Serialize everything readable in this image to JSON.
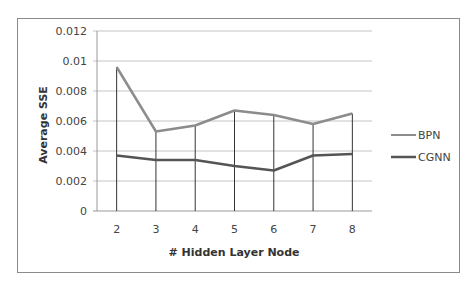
{
  "chart_data": {
    "type": "line",
    "title": "",
    "xlabel": "# Hidden Layer Node",
    "ylabel": "Average SSE",
    "x": [
      2,
      3,
      4,
      5,
      6,
      7,
      8
    ],
    "categories": [
      "2",
      "3",
      "4",
      "5",
      "6",
      "7",
      "8"
    ],
    "ylim": [
      0,
      0.012
    ],
    "yticks": [
      "0",
      "0.002",
      "0.004",
      "0.006",
      "0.008",
      "0.01",
      "0.012"
    ],
    "grid": true,
    "legend_position": "right",
    "series": [
      {
        "name": "BPN",
        "color": "#8c8c8c",
        "values": [
          0.0096,
          0.0053,
          0.0057,
          0.0067,
          0.0064,
          0.0058,
          0.0065
        ]
      },
      {
        "name": "CGNN",
        "color": "#555555",
        "values": [
          0.0037,
          0.0034,
          0.0034,
          0.003,
          0.0027,
          0.0037,
          0.0038
        ]
      }
    ]
  },
  "legend": {
    "items": [
      {
        "label": "BPN",
        "color": "#8c8c8c"
      },
      {
        "label": "CGNN",
        "color": "#555555"
      }
    ]
  },
  "axes": {
    "x_title": "# Hidden Layer Node",
    "y_title": "Average SSE"
  }
}
